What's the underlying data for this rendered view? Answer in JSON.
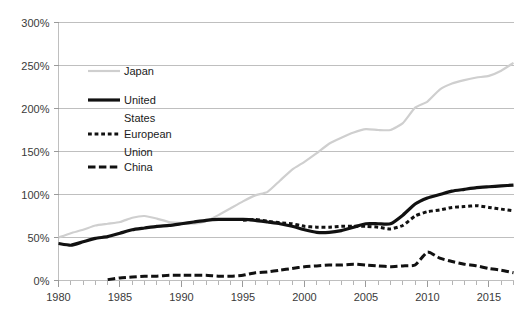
{
  "chart_data": {
    "type": "line",
    "title": "",
    "subtitle": "",
    "xlabel": "",
    "ylabel": "",
    "xlim": [
      1980,
      2017
    ],
    "ylim": [
      0,
      300
    ],
    "y_ticks": [
      0,
      50,
      100,
      150,
      200,
      250,
      300
    ],
    "y_tick_labels": [
      "0%",
      "50%",
      "100%",
      "150%",
      "200%",
      "250%",
      "300%"
    ],
    "x_ticks": [
      1980,
      1985,
      1990,
      1995,
      2000,
      2005,
      2010,
      2015
    ],
    "x_tick_labels": [
      "1980",
      "1985",
      "1990",
      "1995",
      "2000",
      "2005",
      "2010",
      "2015"
    ],
    "x_minor_tick_step": 1,
    "grid": "horizontal",
    "legend_position": "inside-upper-left",
    "units": "percent of GDP",
    "series": [
      {
        "name": "Japan",
        "color": "#cfcfcf",
        "style": "solid",
        "width": 2.2,
        "x": [
          1980,
          1981,
          1982,
          1983,
          1984,
          1985,
          1986,
          1987,
          1988,
          1989,
          1990,
          1991,
          1992,
          1993,
          1994,
          1995,
          1996,
          1997,
          1998,
          1999,
          2000,
          2001,
          2002,
          2003,
          2004,
          2005,
          2006,
          2007,
          2008,
          2009,
          2010,
          2011,
          2012,
          2013,
          2014,
          2015,
          2016,
          2017
        ],
        "values": [
          50,
          55,
          59,
          64,
          66,
          68,
          73,
          75,
          72,
          68,
          67,
          66,
          69,
          76,
          84,
          92,
          99,
          103,
          116,
          129,
          138,
          148,
          159,
          166,
          172,
          176,
          175,
          175,
          183,
          201,
          208,
          222,
          229,
          233,
          236,
          238,
          244,
          253
        ]
      },
      {
        "name": "United States",
        "color": "#111111",
        "style": "solid",
        "width": 3.2,
        "x": [
          1980,
          1981,
          1982,
          1983,
          1984,
          1985,
          1986,
          1987,
          1988,
          1989,
          1990,
          1991,
          1992,
          1993,
          1994,
          1995,
          1996,
          1997,
          1998,
          1999,
          2000,
          2001,
          2002,
          2003,
          2004,
          2005,
          2006,
          2007,
          2008,
          2009,
          2010,
          2011,
          2012,
          2013,
          2014,
          2015,
          2016,
          2017
        ],
        "values": [
          43,
          41,
          45,
          49,
          51,
          55,
          59,
          61,
          63,
          64,
          66,
          68,
          70,
          71,
          71,
          71,
          70,
          68,
          66,
          63,
          59,
          56,
          56,
          58,
          62,
          66,
          66,
          66,
          76,
          89,
          96,
          100,
          104,
          106,
          108,
          109,
          110,
          111
        ]
      },
      {
        "name": "European Union",
        "color": "#111111",
        "style": "dotted",
        "width": 3.0,
        "x": [
          1995,
          1996,
          1997,
          1998,
          1999,
          2000,
          2001,
          2002,
          2003,
          2004,
          2005,
          2006,
          2007,
          2008,
          2009,
          2010,
          2011,
          2012,
          2013,
          2014,
          2015,
          2016,
          2017
        ],
        "values": [
          70,
          71,
          69,
          67,
          66,
          63,
          62,
          62,
          63,
          63,
          63,
          62,
          60,
          64,
          75,
          80,
          82,
          85,
          86,
          87,
          85,
          83,
          81
        ]
      },
      {
        "name": "China",
        "color": "#111111",
        "style": "dashed",
        "width": 3.0,
        "x": [
          1984,
          1985,
          1986,
          1987,
          1988,
          1989,
          1990,
          1991,
          1992,
          1993,
          1994,
          1995,
          1996,
          1997,
          1998,
          1999,
          2000,
          2001,
          2002,
          2003,
          2004,
          2005,
          2006,
          2007,
          2008,
          2009,
          2010,
          2011,
          2012,
          2013,
          2014,
          2015,
          2016,
          2017
        ],
        "values": [
          1,
          3,
          4,
          5,
          5,
          6,
          6,
          6,
          6,
          5,
          5,
          6,
          9,
          10,
          12,
          14,
          16,
          17,
          18,
          18,
          19,
          18,
          17,
          16,
          17,
          18,
          33,
          26,
          22,
          19,
          17,
          14,
          12,
          9
        ]
      }
    ]
  },
  "legend": {
    "items": [
      {
        "label": "Japan",
        "series": "Japan"
      },
      {
        "label": "United",
        "label_line2": "States",
        "series": "United States"
      },
      {
        "label": "European",
        "label_line2": "Union",
        "series": "European Union"
      },
      {
        "label": "China",
        "series": "China"
      }
    ]
  }
}
